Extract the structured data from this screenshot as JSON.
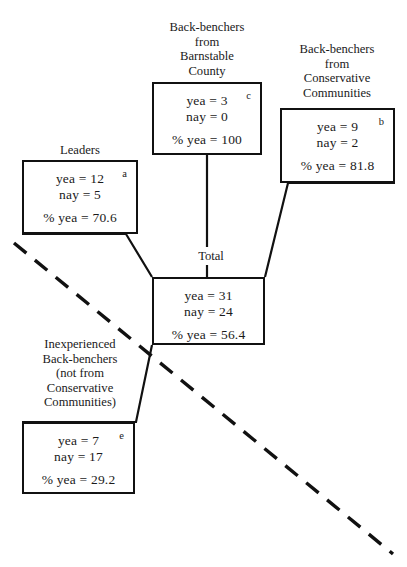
{
  "diagram": {
    "type": "tree-breakdown",
    "watermark": "",
    "total_label": "Total",
    "nodes": [
      {
        "id": "a",
        "tag": "a",
        "caption": "Leaders",
        "yea_line": "yea = 12",
        "nay_line": "nay = 5",
        "pct_line": "% yea = 70.6",
        "yea": 12,
        "nay": 5,
        "pct_yea": 70.6
      },
      {
        "id": "c",
        "tag": "c",
        "caption": "Back-benchers\nfrom\nBarnstable\nCounty",
        "yea_line": "yea = 3",
        "nay_line": "nay = 0",
        "pct_line": "% yea = 100",
        "yea": 3,
        "nay": 0,
        "pct_yea": 100
      },
      {
        "id": "b",
        "tag": "b",
        "caption": "Back-benchers\nfrom\nConservative\nCommunities",
        "yea_line": "yea = 9",
        "nay_line": "nay = 2",
        "pct_line": "% yea = 81.8",
        "yea": 9,
        "nay": 2,
        "pct_yea": 81.8
      },
      {
        "id": "total",
        "tag": "",
        "caption": "Total",
        "yea_line": "yea = 31",
        "nay_line": "nay = 24",
        "pct_line": "% yea = 56.4",
        "yea": 31,
        "nay": 24,
        "pct_yea": 56.4
      },
      {
        "id": "e",
        "tag": "e",
        "caption": "Inexperienced\nBack-benchers\n(not from\nConservative\nCommunities)",
        "yea_line": "yea = 7",
        "nay_line": "nay = 17",
        "pct_line": "% yea = 29.2",
        "yea": 7,
        "nay": 17,
        "pct_yea": 29.2
      }
    ],
    "colors": {
      "stroke": "#111111",
      "background": "#ffffff",
      "text": "#1a1a1a"
    }
  }
}
